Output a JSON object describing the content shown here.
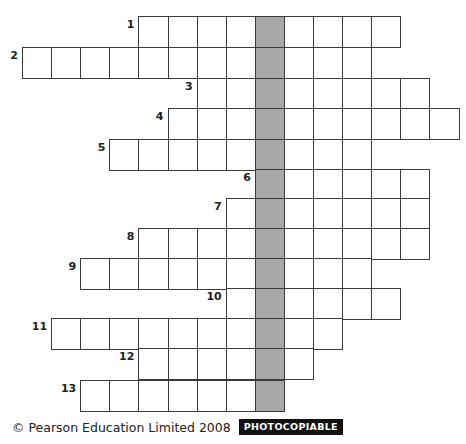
{
  "puzzle": {
    "grid": {
      "origin_x": 22,
      "col_width": 29.1,
      "row_tops": [
        16,
        47,
        78,
        108,
        139,
        169,
        198,
        228,
        258,
        288,
        318,
        348,
        380
      ],
      "row_height": 30.5,
      "shaded_col": 8,
      "shaded_color": "#a8a8a8"
    },
    "rows": [
      {
        "number": "1",
        "start_col": 4,
        "length": 9
      },
      {
        "number": "2",
        "start_col": 0,
        "length": 12
      },
      {
        "number": "3",
        "start_col": 6,
        "length": 8
      },
      {
        "number": "4",
        "start_col": 5,
        "length": 10
      },
      {
        "number": "5",
        "start_col": 3,
        "length": 9
      },
      {
        "number": "6",
        "start_col": 8,
        "length": 6
      },
      {
        "number": "7",
        "start_col": 7,
        "length": 7
      },
      {
        "number": "8",
        "start_col": 4,
        "length": 10
      },
      {
        "number": "9",
        "start_col": 2,
        "length": 10
      },
      {
        "number": "10",
        "start_col": 7,
        "length": 6
      },
      {
        "number": "11",
        "start_col": 1,
        "length": 10
      },
      {
        "number": "12",
        "start_col": 4,
        "length": 6
      },
      {
        "number": "13",
        "start_col": 2,
        "length": 7
      }
    ]
  },
  "footer": {
    "copyright": "© Pearson Education Limited 2008",
    "badge": "PHOTOCOPIABLE"
  }
}
